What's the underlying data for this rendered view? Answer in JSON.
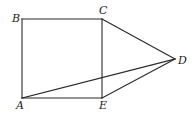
{
  "diagram": {
    "type": "geometry",
    "points": {
      "A": {
        "label": "A",
        "x": 22,
        "y": 98,
        "label_x": 16,
        "label_y": 109
      },
      "B": {
        "label": "B",
        "x": 22,
        "y": 19,
        "label_x": 12,
        "label_y": 22
      },
      "C": {
        "label": "C",
        "x": 102,
        "y": 19,
        "label_x": 99,
        "label_y": 14
      },
      "D": {
        "label": "D",
        "x": 175,
        "y": 59,
        "label_x": 178,
        "label_y": 64
      },
      "E": {
        "label": "E",
        "x": 102,
        "y": 98,
        "label_x": 99,
        "label_y": 109
      }
    },
    "segments": [
      {
        "name": "AB",
        "from": "A",
        "to": "B"
      },
      {
        "name": "BC",
        "from": "B",
        "to": "C"
      },
      {
        "name": "CE",
        "from": "C",
        "to": "E"
      },
      {
        "name": "AE",
        "from": "A",
        "to": "E"
      },
      {
        "name": "CD",
        "from": "C",
        "to": "D"
      },
      {
        "name": "ED",
        "from": "E",
        "to": "D"
      },
      {
        "name": "AD",
        "from": "A",
        "to": "D"
      }
    ],
    "colors": {
      "line": "#2a2a2a",
      "label": "#222222",
      "background": "#ffffff"
    }
  }
}
